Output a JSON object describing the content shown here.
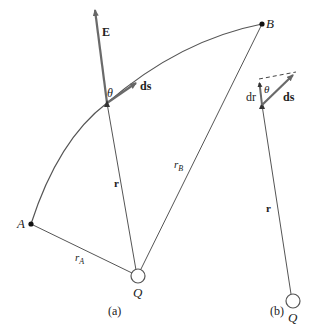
{
  "figure": {
    "panel_a": {
      "caption": "(a)",
      "labels": {
        "E": "E",
        "theta": "θ",
        "ds": "ds",
        "r": "r",
        "rB_main": "r",
        "rB_sub": "B",
        "rA_main": "r",
        "rA_sub": "A",
        "A": "A",
        "B": "B",
        "Q": "Q"
      }
    },
    "panel_b": {
      "caption": "(b)",
      "labels": {
        "dr": "dr",
        "theta": "θ",
        "ds": "ds",
        "r": "r",
        "Q": "Q"
      }
    },
    "colors": {
      "line": "#555555",
      "vector": "#6a6a6a",
      "point": "#111111"
    }
  }
}
